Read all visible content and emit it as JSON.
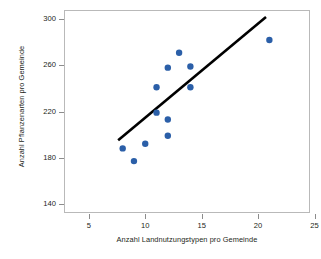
{
  "chart_data": {
    "type": "scatter",
    "title": "",
    "xlabel": "Anzahl Landnutzungstypen pro Gemeinde",
    "ylabel": "Anzahl Pflanzenarten pro Gemeinde",
    "xlim": [
      2.8,
      24.6
    ],
    "ylim": [
      132,
      308
    ],
    "xticks": [
      5,
      10,
      15,
      20,
      25
    ],
    "xtick_labels": [
      "5",
      "10",
      "15",
      "20",
      "25"
    ],
    "yticks": [
      140,
      180,
      220,
      260,
      300
    ],
    "ytick_labels": [
      "140",
      "180",
      "220",
      "260",
      "300"
    ],
    "grid": false,
    "legend": null,
    "marker_color": "#2b5fa8",
    "marker_size": 6.4,
    "series": [
      {
        "name": "Gemeinden",
        "x": [
          8,
          9,
          10,
          11,
          11,
          12,
          12,
          12,
          13,
          14,
          14,
          21
        ],
        "y": [
          188,
          177,
          192,
          219,
          241,
          199,
          213,
          258,
          271,
          241,
          259,
          282
        ]
      }
    ],
    "trendline": {
      "name": "Regressionsgerade",
      "color": "#000000",
      "width": 2.6,
      "x": [
        7.6,
        20.7
      ],
      "y": [
        195,
        302
      ]
    }
  }
}
